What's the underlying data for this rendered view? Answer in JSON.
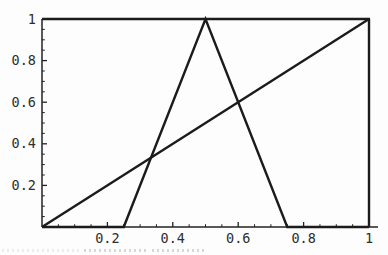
{
  "figure": {
    "background": "#fdfdfd",
    "line_color": "#1b1b1b",
    "axis_color": "#222222",
    "label_color": "#2e2e2e"
  },
  "chart_data": {
    "type": "line",
    "title": "",
    "xlabel": "",
    "ylabel": "",
    "xlim": [
      0,
      1
    ],
    "ylim": [
      0,
      1
    ],
    "grid": false,
    "legend": "none",
    "frame_box": true,
    "x_major_ticks": [
      0.2,
      0.4,
      0.6,
      0.8,
      1
    ],
    "x_tick_labels": [
      "0.2",
      "0.4",
      "0.6",
      "0.8",
      "1"
    ],
    "y_major_ticks": [
      0.2,
      0.4,
      0.6,
      0.8,
      1
    ],
    "y_tick_labels": [
      "1",
      "0.8",
      "0.6",
      "0.4",
      "0.2"
    ],
    "y_tick_label_values": [
      1,
      0.8,
      0.6,
      0.4,
      0.2
    ],
    "minor_tick_step": 0.05,
    "series": [
      {
        "name": "triangular membership function",
        "points": [
          [
            0,
            0
          ],
          [
            0.25,
            0
          ],
          [
            0.5,
            1
          ],
          [
            0.75,
            0
          ],
          [
            1,
            0
          ]
        ]
      },
      {
        "name": "identity line y = x",
        "points": [
          [
            0,
            0
          ],
          [
            1,
            1
          ]
        ]
      }
    ]
  }
}
